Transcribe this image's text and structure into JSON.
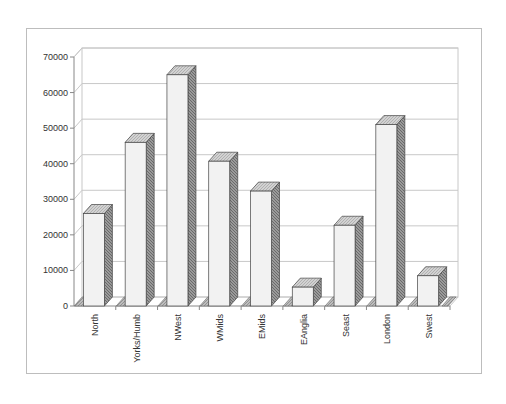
{
  "chart_data": {
    "type": "bar",
    "style": "3d-column",
    "title": "",
    "xlabel": "",
    "ylabel": "",
    "categories": [
      "North",
      "Yorks/Humb",
      "NWest",
      "WMids",
      "EMids",
      "EAnglia",
      "Seast",
      "London",
      "Swest"
    ],
    "values": [
      26000,
      46000,
      65000,
      40700,
      32300,
      5300,
      22700,
      51000,
      8500
    ],
    "ylim": [
      0,
      70000
    ],
    "yticks": [
      "0",
      "10000",
      "20000",
      "30000",
      "40000",
      "50000",
      "60000",
      "70000"
    ],
    "grid": true,
    "legend": "none",
    "colors": {
      "bar_front": "#f2f2f2",
      "bar_top": "#c8c8c8",
      "bar_side": "#8a8a8a",
      "gridline": "#c8c8c8",
      "axis": "#888888",
      "frame": "#bdbdbd"
    }
  }
}
